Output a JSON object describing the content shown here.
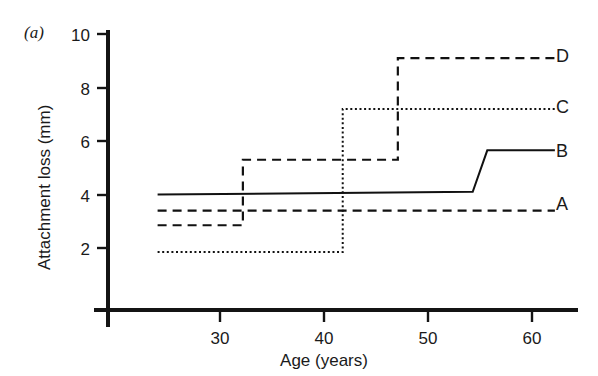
{
  "figure": {
    "panel_label": "(a)",
    "background_color": "#ffffff",
    "line_color": "#111111"
  },
  "chart_data": {
    "type": "line",
    "subtype": "step",
    "title": "",
    "panel": "(a)",
    "xlabel": "Age (years)",
    "ylabel": "Attachment loss (mm)",
    "xlim": [
      19.2,
      62.5
    ],
    "ylim": [
      0,
      10
    ],
    "xticks": [
      30,
      40,
      50,
      60
    ],
    "xtick_labels": [
      "30",
      "40",
      "50",
      "60"
    ],
    "yticks": [
      2,
      4,
      6,
      8,
      10
    ],
    "ytick_labels": [
      "2",
      "4",
      "6",
      "8",
      "10"
    ],
    "grid": false,
    "legend_position": "right-of-axes-inline",
    "series": [
      {
        "name": "A",
        "label": "A",
        "linestyle": "dashed",
        "x": [
          24.0,
          62.2
        ],
        "y": [
          3.4,
          3.4
        ],
        "description": "flat dashed line at 3.4 mm with no step"
      },
      {
        "name": "B",
        "label": "B",
        "linestyle": "solid",
        "x": [
          24.0,
          54.3,
          55.7,
          62.2
        ],
        "y": [
          4.0,
          4.1,
          5.65,
          5.65
        ],
        "description": "solid line near 4.0 mm rising to 5.65 mm around age 55"
      },
      {
        "name": "C",
        "label": "C",
        "linestyle": "dotted",
        "x": [
          24.0,
          41.8,
          41.8,
          62.2
        ],
        "y": [
          1.85,
          1.85,
          7.2,
          7.2
        ],
        "description": "dotted line stepping from 1.85 mm to 7.2 mm at age 42"
      },
      {
        "name": "D",
        "label": "D",
        "linestyle": "dashed",
        "x": [
          24.0,
          32.2,
          32.2,
          47.1,
          47.1,
          62.2
        ],
        "y": [
          2.85,
          2.85,
          5.3,
          5.3,
          9.1,
          9.1
        ],
        "description": "dashed line stepping from 2.85 to 5.3 mm at age 32 and to 9.1 mm at age 47"
      }
    ]
  }
}
